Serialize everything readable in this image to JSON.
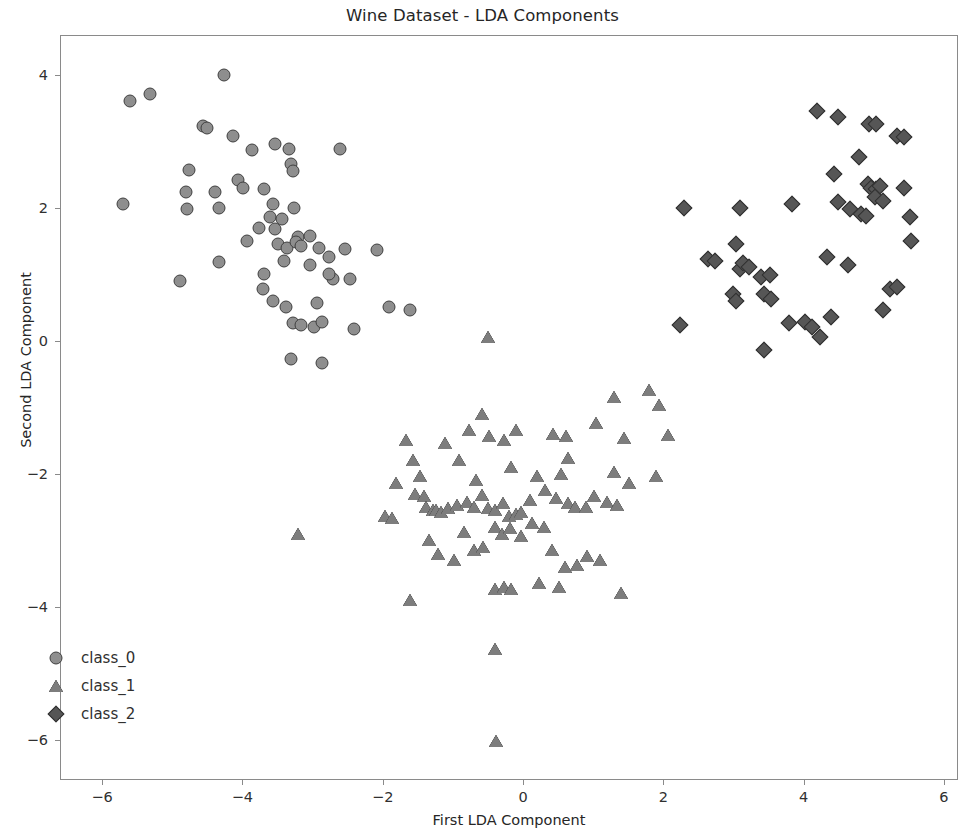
{
  "chart_data": {
    "type": "scatter",
    "title": "Wine Dataset - LDA Components",
    "xlabel": "First LDA Component",
    "ylabel": "Second LDA Component",
    "xlim": [
      -6.6,
      6.2
    ],
    "ylim": [
      -6.6,
      4.6
    ],
    "xticks": [
      "−6",
      "−4",
      "−2",
      "0",
      "2",
      "4",
      "6"
    ],
    "xtick_values": [
      -6,
      -4,
      -2,
      0,
      2,
      4,
      6
    ],
    "yticks": [
      "4",
      "2",
      "0",
      "−2",
      "−4",
      "−6"
    ],
    "ytick_values": [
      4,
      2,
      0,
      -2,
      -4,
      -6
    ],
    "grid": false,
    "legend_position": "lower left",
    "series": [
      {
        "name": "class_0",
        "marker": "circle",
        "color": "#8e8e8e",
        "edge_color": "#3f3f3f",
        "points": [
          [
            -5.62,
            3.63
          ],
          [
            -5.33,
            3.73
          ],
          [
            -4.28,
            4.02
          ],
          [
            -4.58,
            3.25
          ],
          [
            -4.52,
            3.22
          ],
          [
            -4.15,
            3.1
          ],
          [
            -3.88,
            2.88
          ],
          [
            -3.55,
            2.98
          ],
          [
            -3.35,
            2.9
          ],
          [
            -3.32,
            2.68
          ],
          [
            -3.3,
            2.57
          ],
          [
            -2.62,
            2.9
          ],
          [
            -4.78,
            2.58
          ],
          [
            -5.72,
            2.08
          ],
          [
            -4.82,
            2.26
          ],
          [
            -4.8,
            2.0
          ],
          [
            -4.4,
            2.25
          ],
          [
            -4.35,
            2.02
          ],
          [
            -4.08,
            2.43
          ],
          [
            -4.0,
            2.32
          ],
          [
            -3.7,
            2.3
          ],
          [
            -3.58,
            2.08
          ],
          [
            -3.28,
            2.02
          ],
          [
            -3.22,
            1.58
          ],
          [
            -3.55,
            1.7
          ],
          [
            -3.5,
            1.48
          ],
          [
            -3.38,
            1.42
          ],
          [
            -3.25,
            1.5
          ],
          [
            -3.18,
            1.45
          ],
          [
            -3.05,
            1.6
          ],
          [
            -2.92,
            1.42
          ],
          [
            -2.78,
            1.28
          ],
          [
            -2.55,
            1.4
          ],
          [
            -2.1,
            1.38
          ],
          [
            -4.35,
            1.2
          ],
          [
            -4.9,
            0.92
          ],
          [
            -3.72,
            0.8
          ],
          [
            -3.58,
            0.62
          ],
          [
            -3.4,
            0.52
          ],
          [
            -3.3,
            0.28
          ],
          [
            -3.18,
            0.25
          ],
          [
            -3.0,
            0.22
          ],
          [
            -2.88,
            0.3
          ],
          [
            -2.72,
            0.95
          ],
          [
            -2.78,
            1.02
          ],
          [
            -2.48,
            0.95
          ],
          [
            -2.42,
            0.2
          ],
          [
            -1.92,
            0.52
          ],
          [
            -1.62,
            0.48
          ],
          [
            -3.32,
            -0.25
          ],
          [
            -2.88,
            -0.32
          ],
          [
            -3.42,
            1.22
          ],
          [
            -3.05,
            1.15
          ],
          [
            -2.95,
            0.58
          ],
          [
            -3.62,
            1.88
          ],
          [
            -3.45,
            1.85
          ],
          [
            -3.78,
            1.72
          ],
          [
            -3.95,
            1.52
          ],
          [
            -3.7,
            1.02
          ]
        ]
      },
      {
        "name": "class_1",
        "marker": "triangle",
        "color": "#7d7d7d",
        "edge_color": "#3a3a3a",
        "points": [
          [
            -0.52,
            0.08
          ],
          [
            -0.6,
            -1.08
          ],
          [
            -0.78,
            -1.32
          ],
          [
            -0.5,
            -1.42
          ],
          [
            -0.28,
            -1.48
          ],
          [
            -0.12,
            -1.32
          ],
          [
            0.42,
            -1.38
          ],
          [
            0.6,
            -1.42
          ],
          [
            1.02,
            -1.22
          ],
          [
            1.28,
            -0.82
          ],
          [
            1.78,
            -0.72
          ],
          [
            1.92,
            -0.95
          ],
          [
            2.05,
            -1.4
          ],
          [
            -1.82,
            -2.12
          ],
          [
            -1.98,
            -2.62
          ],
          [
            -1.88,
            -2.65
          ],
          [
            -1.55,
            -2.28
          ],
          [
            -1.42,
            -2.32
          ],
          [
            -1.4,
            -2.48
          ],
          [
            -1.3,
            -2.52
          ],
          [
            -1.25,
            -2.52
          ],
          [
            -1.18,
            -2.55
          ],
          [
            -1.08,
            -2.5
          ],
          [
            -0.95,
            -2.45
          ],
          [
            -0.82,
            -2.4
          ],
          [
            -0.72,
            -2.48
          ],
          [
            -0.6,
            -2.3
          ],
          [
            -0.52,
            -2.5
          ],
          [
            -0.42,
            -2.52
          ],
          [
            -0.3,
            -2.42
          ],
          [
            -0.22,
            -2.62
          ],
          [
            -0.12,
            -2.58
          ],
          [
            -0.05,
            -2.55
          ],
          [
            0.08,
            -2.38
          ],
          [
            0.18,
            -2.02
          ],
          [
            0.3,
            -2.22
          ],
          [
            0.45,
            -2.35
          ],
          [
            0.62,
            -2.42
          ],
          [
            0.72,
            -2.48
          ],
          [
            0.88,
            -2.48
          ],
          [
            1.0,
            -2.32
          ],
          [
            1.18,
            -2.4
          ],
          [
            1.32,
            -2.45
          ],
          [
            -1.62,
            -3.88
          ],
          [
            -1.35,
            -2.98
          ],
          [
            -1.22,
            -3.18
          ],
          [
            -1.0,
            -3.28
          ],
          [
            -0.85,
            -2.85
          ],
          [
            -0.72,
            -3.12
          ],
          [
            -0.58,
            -3.08
          ],
          [
            -0.42,
            -2.78
          ],
          [
            -0.32,
            -2.88
          ],
          [
            -0.2,
            -2.8
          ],
          [
            -0.05,
            -2.92
          ],
          [
            0.12,
            -2.72
          ],
          [
            0.28,
            -2.78
          ],
          [
            0.4,
            -3.12
          ],
          [
            0.58,
            -3.38
          ],
          [
            0.75,
            -3.35
          ],
          [
            0.9,
            -3.22
          ],
          [
            1.08,
            -3.28
          ],
          [
            -0.42,
            -3.72
          ],
          [
            -0.28,
            -3.68
          ],
          [
            -0.18,
            -3.72
          ],
          [
            0.22,
            -3.62
          ],
          [
            0.5,
            -3.68
          ],
          [
            1.38,
            -3.78
          ],
          [
            -0.42,
            -4.62
          ],
          [
            -0.4,
            -6.0
          ],
          [
            -3.22,
            -2.88
          ],
          [
            -1.68,
            -1.48
          ],
          [
            -1.58,
            -1.78
          ],
          [
            -1.48,
            -2.02
          ],
          [
            -1.12,
            -1.52
          ],
          [
            -0.92,
            -1.78
          ],
          [
            -0.18,
            -1.88
          ],
          [
            0.62,
            -1.75
          ],
          [
            1.28,
            -1.95
          ],
          [
            1.5,
            -2.12
          ],
          [
            1.88,
            -2.02
          ],
          [
            -0.68,
            -2.08
          ],
          [
            0.52,
            -1.98
          ],
          [
            1.42,
            -1.45
          ]
        ]
      },
      {
        "name": "class_2",
        "marker": "diamond",
        "color": "#565656",
        "edge_color": "#2f2f2f",
        "points": [
          [
            4.18,
            3.48
          ],
          [
            4.48,
            3.38
          ],
          [
            4.92,
            3.28
          ],
          [
            5.02,
            3.28
          ],
          [
            5.32,
            3.1
          ],
          [
            5.42,
            3.08
          ],
          [
            4.78,
            2.78
          ],
          [
            4.42,
            2.52
          ],
          [
            4.9,
            2.38
          ],
          [
            4.95,
            2.32
          ],
          [
            5.02,
            2.3
          ],
          [
            5.08,
            2.35
          ],
          [
            5.0,
            2.18
          ],
          [
            5.12,
            2.12
          ],
          [
            5.42,
            2.32
          ],
          [
            4.65,
            2.0
          ],
          [
            4.8,
            1.92
          ],
          [
            4.88,
            1.9
          ],
          [
            5.5,
            1.88
          ],
          [
            2.28,
            2.02
          ],
          [
            3.08,
            2.02
          ],
          [
            3.82,
            2.08
          ],
          [
            2.62,
            1.25
          ],
          [
            2.72,
            1.22
          ],
          [
            3.02,
            1.48
          ],
          [
            3.08,
            1.1
          ],
          [
            3.12,
            1.18
          ],
          [
            3.2,
            1.12
          ],
          [
            4.32,
            1.28
          ],
          [
            4.62,
            1.15
          ],
          [
            5.52,
            1.52
          ],
          [
            3.38,
            0.98
          ],
          [
            3.5,
            1.0
          ],
          [
            2.98,
            0.72
          ],
          [
            3.02,
            0.62
          ],
          [
            3.42,
            0.72
          ],
          [
            3.52,
            0.65
          ],
          [
            3.78,
            0.28
          ],
          [
            4.0,
            0.3
          ],
          [
            4.1,
            0.22
          ],
          [
            4.38,
            0.38
          ],
          [
            4.22,
            0.08
          ],
          [
            5.22,
            0.8
          ],
          [
            5.32,
            0.82
          ],
          [
            5.12,
            0.48
          ],
          [
            2.22,
            0.25
          ],
          [
            3.42,
            -0.12
          ],
          [
            4.48,
            2.1
          ]
        ]
      }
    ]
  },
  "legend": {
    "items": [
      {
        "label": "class_0",
        "marker": "circle"
      },
      {
        "label": "class_1",
        "marker": "triangle"
      },
      {
        "label": "class_2",
        "marker": "diamond"
      }
    ]
  }
}
